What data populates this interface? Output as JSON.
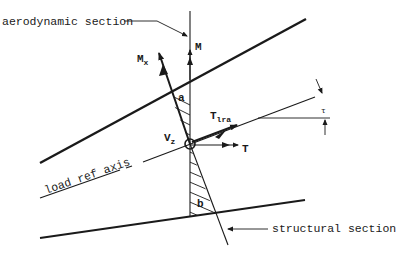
{
  "diagram": {
    "type": "engineering-section-diagram",
    "colors": {
      "ink": "#1a1a1a",
      "background": "#ffffff"
    },
    "labels": {
      "aerodynamic_section": "aerodynamic section",
      "structural_section": "structural section",
      "load_ref_axis": "load ref axis",
      "M": "M",
      "Mx_main": "M",
      "Mx_sub": "x",
      "Vz_main": "V",
      "Vz_sub": "z",
      "T": "T",
      "Tlra_main": "T",
      "Tlra_sub": "lra",
      "angle_a": "a",
      "angle_b": "b",
      "tau": "τ"
    }
  }
}
